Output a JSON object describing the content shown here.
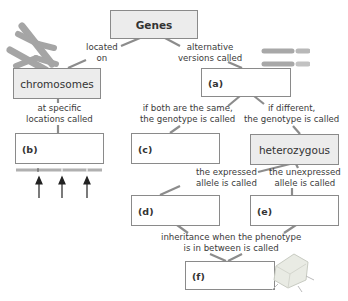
{
  "diagram": {
    "root": {
      "label": "Genes"
    },
    "nodes": {
      "chromosomes": {
        "label": "chromosomes"
      },
      "a": {
        "label": "(a)"
      },
      "b": {
        "label": "(b)"
      },
      "c": {
        "label": "(c)"
      },
      "heterozygous": {
        "label": "heterozygous"
      },
      "d": {
        "label": "(d)"
      },
      "e": {
        "label": "(e)"
      },
      "f": {
        "label": "(f)"
      }
    },
    "links": {
      "located_on": {
        "line1": "located",
        "line2": "on"
      },
      "alternative": {
        "line1": "alternative",
        "line2": "versions called"
      },
      "specific": {
        "line1": "at specific",
        "line2": "locations called"
      },
      "same": {
        "line1": "if both are the same,",
        "line2": "the genotype is called"
      },
      "different": {
        "line1": "if different,",
        "line2": "the genotype is called"
      },
      "expressed": {
        "line1": "the expressed",
        "line2": "allele is called"
      },
      "unexpressed": {
        "line1": "the unexpressed",
        "line2": "allele is called"
      },
      "inbetween": {
        "line1": "inheritance when the phenotype",
        "line2": "is in between is called"
      }
    },
    "colors": {
      "box_border": "#8a8a8a",
      "gray_box": "#ececec",
      "line": "#8c8c8c",
      "chromosome": "#a9a9a9"
    }
  }
}
